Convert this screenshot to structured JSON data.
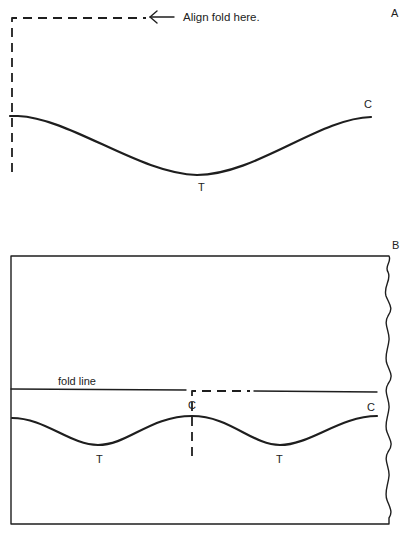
{
  "panel_a": {
    "label": "A",
    "instruction": "Align fold here.",
    "crest_label": "C",
    "trough_label": "T"
  },
  "panel_b": {
    "label": "B",
    "fold_line_label": "fold line",
    "crest_center_label": "C",
    "crest_right_label": "C",
    "trough_left_label": "T",
    "trough_right_label": "T"
  },
  "colors": {
    "ink": "#1e1e1e",
    "paper": "#ffffff"
  }
}
